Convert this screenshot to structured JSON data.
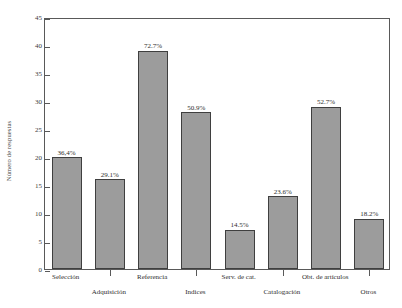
{
  "chart_data": {
    "type": "bar",
    "title": "",
    "subtitle": "",
    "xlabel": "",
    "ylabel": "Número de respuestas",
    "ylim": [
      0,
      45
    ],
    "yticks": [
      0,
      5,
      10,
      15,
      20,
      25,
      30,
      35,
      40,
      45
    ],
    "grid": false,
    "legend": null,
    "bar_color": "#9c9c9c",
    "bar_edge_color": "#3f3f3f",
    "axis_color": "#595959",
    "categories": [
      "Selección",
      "Adquisición",
      "Referencia",
      "Indices",
      "Serv. de cat.",
      "Catalogación",
      "Obt. de artículos",
      "Otros"
    ],
    "values": [
      20,
      16,
      39,
      28,
      7,
      13,
      29,
      9
    ],
    "data_labels": [
      "36,4%",
      "29.1%",
      "72.7%",
      "50.9%",
      "14.5%",
      "23.6%",
      "52.7%",
      "18.2%"
    ],
    "label_rows": [
      "top",
      "bottom",
      "top",
      "bottom",
      "top",
      "bottom",
      "top",
      "bottom"
    ]
  }
}
